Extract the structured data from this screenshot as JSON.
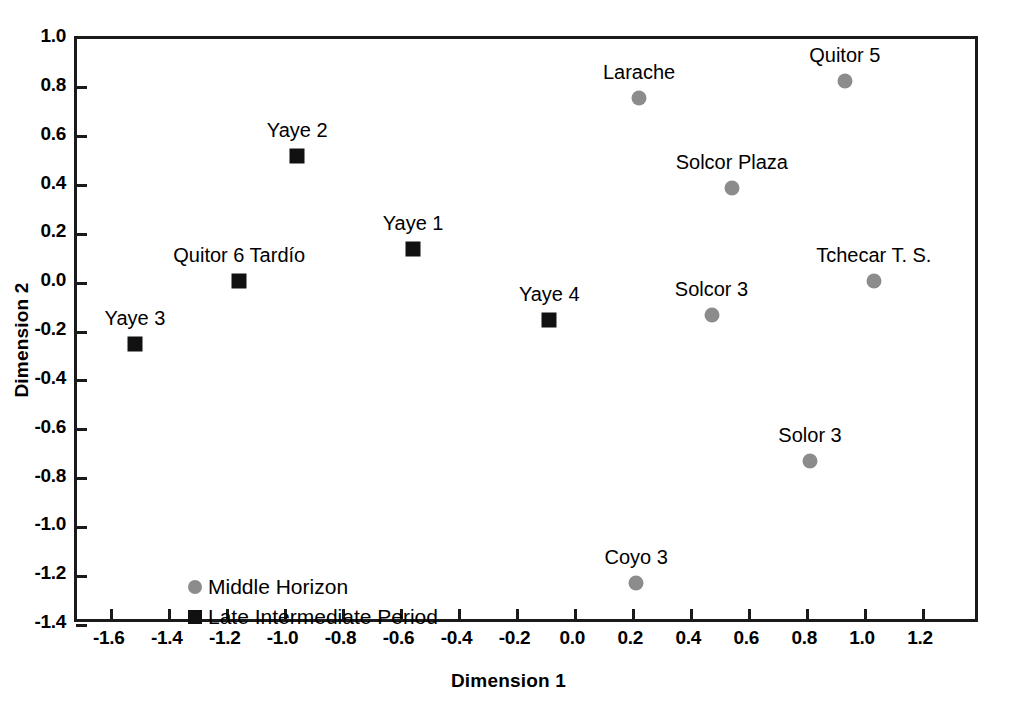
{
  "chart_data": {
    "type": "scatter",
    "title": "",
    "xlabel": "Dimension 1",
    "ylabel": "Dimension 2",
    "xlim": [
      -1.72,
      1.4
    ],
    "ylim": [
      -1.4,
      1.0
    ],
    "xticks": [
      "-1.6",
      "-1.4",
      "-1.2",
      "-1.0",
      "-0.8",
      "-0.6",
      "-0.4",
      "-0.2",
      "0.0",
      "0.2",
      "0.4",
      "0.6",
      "0.8",
      "1.0",
      "1.2"
    ],
    "xtick_values": [
      -1.6,
      -1.4,
      -1.2,
      -1.0,
      -0.8,
      -0.6,
      -0.4,
      -0.2,
      0.0,
      0.2,
      0.4,
      0.6,
      0.8,
      1.0,
      1.2
    ],
    "yticks": [
      "1.0",
      "0.8",
      "0.6",
      "0.4",
      "0.2",
      "0.0",
      "-0.2",
      "-0.4",
      "-0.6",
      "-0.8",
      "-1.0",
      "-1.2",
      "-1.4"
    ],
    "ytick_values": [
      1.0,
      0.8,
      0.6,
      0.4,
      0.2,
      0.0,
      -0.2,
      -0.4,
      -0.6,
      -0.8,
      -1.0,
      -1.2,
      -1.4
    ],
    "grid": false,
    "legend_position": "lower-left-inside",
    "colors": {
      "middle_horizon": "#8c8c8c",
      "late_intermediate_period": "#111111",
      "axis": "#1a1a1a",
      "background": "#ffffff"
    },
    "series": [
      {
        "name": "Middle Horizon",
        "marker": "circle",
        "color": "#8c8c8c",
        "points": [
          {
            "label": "Larache",
            "x": 0.22,
            "y": 0.76,
            "label_dx": 0,
            "label_dy": -14
          },
          {
            "label": "Quitor 5",
            "x": 0.93,
            "y": 0.83,
            "label_dx": 0,
            "label_dy": -14
          },
          {
            "label": "Solcor Plaza",
            "x": 0.54,
            "y": 0.39,
            "label_dx": 0,
            "label_dy": -14
          },
          {
            "label": "Tchecar T. S.",
            "x": 1.03,
            "y": 0.01,
            "label_dx": 0,
            "label_dy": -14
          },
          {
            "label": "Solcor 3",
            "x": 0.47,
            "y": -0.13,
            "label_dx": 0,
            "label_dy": -14
          },
          {
            "label": "Solor 3",
            "x": 0.81,
            "y": -0.73,
            "label_dx": 0,
            "label_dy": -14
          },
          {
            "label": "Coyo 3",
            "x": 0.21,
            "y": -1.23,
            "label_dx": 0,
            "label_dy": -14
          }
        ]
      },
      {
        "name": "Late Intermediate Period",
        "marker": "square",
        "color": "#111111",
        "points": [
          {
            "label": "Yaye 2",
            "x": -0.96,
            "y": 0.52,
            "label_dx": 0,
            "label_dy": -14
          },
          {
            "label": "Yaye 1",
            "x": -0.56,
            "y": 0.14,
            "label_dx": 0,
            "label_dy": -14
          },
          {
            "label": "Quitor 6 Tardío",
            "x": -1.16,
            "y": 0.01,
            "label_dx": 0,
            "label_dy": -14
          },
          {
            "label": "Yaye 4",
            "x": -0.09,
            "y": -0.15,
            "label_dx": 0,
            "label_dy": -14
          },
          {
            "label": "Yaye 3",
            "x": -1.52,
            "y": -0.25,
            "label_dx": 0,
            "label_dy": -14
          }
        ]
      }
    ],
    "legend": [
      {
        "label": "Middle Horizon",
        "marker": "circle",
        "color": "#8c8c8c"
      },
      {
        "label": "Late Intermediate Period",
        "marker": "square",
        "color": "#111111"
      }
    ]
  }
}
